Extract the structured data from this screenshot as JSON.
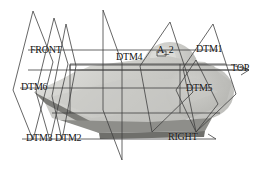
{
  "diagram": {
    "canvas": {
      "width": 265,
      "height": 173,
      "background": "#ffffff"
    },
    "colors": {
      "outline": "#3a3a3a",
      "plane_edge": "#4a4a4a",
      "solid_top_light": "#d8d8d4",
      "solid_top_mid": "#c2c2be",
      "solid_side": "#a8a8a4",
      "solid_dark_edge": "#7e7e7a",
      "solid_shadow": "#8c8c88",
      "dome_light": "#cfcfcb",
      "dome_mid": "#b4b4b0",
      "text": "#111111"
    },
    "labels": [
      {
        "id": "front",
        "text": "FRONT",
        "x": 30,
        "y": 45
      },
      {
        "id": "dtm4",
        "text": "DTM4",
        "x": 116,
        "y": 52
      },
      {
        "id": "a2",
        "text": "A_2",
        "x": 157,
        "y": 48
      },
      {
        "id": "dtm1",
        "text": "DTM1",
        "x": 196,
        "y": 45
      },
      {
        "id": "top",
        "text": "TOP",
        "x": 231,
        "y": 65
      },
      {
        "id": "dtm6",
        "text": "DTM6",
        "x": 21,
        "y": 82
      },
      {
        "id": "dtm5",
        "text": "DTM5",
        "x": 186,
        "y": 84
      },
      {
        "id": "dtm3",
        "text": "DTM3",
        "x": 26,
        "y": 135
      },
      {
        "id": "dtm2",
        "text": "DTM2",
        "x": 54,
        "y": 135
      },
      {
        "id": "right",
        "text": "RIGHT",
        "x": 168,
        "y": 134
      }
    ],
    "datum_planes": [
      {
        "name": "DTM3",
        "shape": "diamond",
        "orientation": "edge-on-left"
      },
      {
        "name": "DTM2",
        "shape": "diamond",
        "orientation": "edge-on-left"
      },
      {
        "name": "DTM6",
        "shape": "diamond",
        "orientation": "edge-on-left"
      },
      {
        "name": "DTM4",
        "shape": "tall-vertical",
        "orientation": "front-facing"
      },
      {
        "name": "A_2",
        "shape": "diamond",
        "orientation": "center"
      },
      {
        "name": "DTM1",
        "shape": "diamond",
        "orientation": "right"
      },
      {
        "name": "DTM5",
        "shape": "diamond",
        "orientation": "right"
      },
      {
        "name": "FRONT",
        "shape": "reference-plane",
        "orientation": "left"
      },
      {
        "name": "TOP",
        "shape": "reference-plane",
        "orientation": "horizontal"
      },
      {
        "name": "RIGHT",
        "shape": "reference-plane",
        "orientation": "bottom-right"
      }
    ],
    "solid": {
      "description": "shaded wedge body with rounded dome feature",
      "visible": true
    }
  }
}
